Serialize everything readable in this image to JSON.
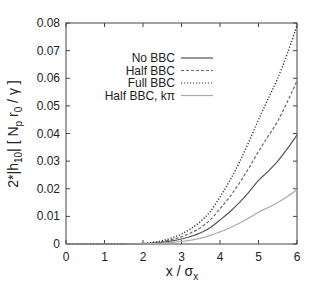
{
  "chart_data": {
    "type": "line",
    "title": "",
    "xlabel": "x / σ_x",
    "xlabel_main": "x / σ",
    "xlabel_sub": "x",
    "ylabel": "2*|h10| [Np r0 / γ]",
    "ylabel_parts": {
      "prefix": "2*|h",
      "sub1": "10",
      "mid": "|  [ N",
      "sub2": "p",
      "mid2": " r",
      "sub3": "0",
      "suffix": " / γ ]"
    },
    "xlim": [
      0,
      6
    ],
    "ylim": [
      0,
      0.08
    ],
    "xticks": [
      0,
      1,
      2,
      3,
      4,
      5,
      6
    ],
    "xtick_labels": [
      "0",
      "1",
      "2",
      "3",
      "4",
      "5",
      "6"
    ],
    "yticks": [
      0,
      0.01,
      0.02,
      0.03,
      0.04,
      0.05,
      0.06,
      0.07,
      0.08
    ],
    "ytick_labels": [
      "0",
      "0.01",
      "0.02",
      "0.03",
      "0.04",
      "0.05",
      "0.06",
      "0.07",
      "0.08"
    ],
    "grid": false,
    "legend_position": "upper-center-right (inside)",
    "x": [
      0,
      0.5,
      1,
      1.5,
      2,
      2.25,
      2.5,
      2.75,
      3,
      3.25,
      3.5,
      3.75,
      4,
      4.25,
      4.5,
      4.75,
      5,
      5.25,
      5.5,
      5.75,
      6
    ],
    "series": [
      {
        "name": "No BBC",
        "style": "solid",
        "color": "#555555",
        "values": [
          0,
          0,
          0,
          1e-05,
          0.0001,
          0.0003,
          0.0006,
          0.0011,
          0.0018,
          0.0028,
          0.0041,
          0.006,
          0.0087,
          0.0116,
          0.015,
          0.0188,
          0.023,
          0.0263,
          0.03,
          0.0345,
          0.0395
        ]
      },
      {
        "name": "Half BBC",
        "style": "dashed",
        "color": "#666666",
        "values": [
          0,
          0,
          0,
          2e-05,
          0.00015,
          0.0004,
          0.0009,
          0.0016,
          0.0026,
          0.0041,
          0.006,
          0.0088,
          0.0128,
          0.017,
          0.022,
          0.0275,
          0.0335,
          0.039,
          0.0445,
          0.0515,
          0.059
        ]
      },
      {
        "name": "Full BBC",
        "style": "dotted",
        "color": "#333333",
        "values": [
          0,
          0,
          0,
          2e-05,
          0.0002,
          0.0006,
          0.0012,
          0.0022,
          0.0036,
          0.0056,
          0.0082,
          0.0118,
          0.017,
          0.0228,
          0.0295,
          0.037,
          0.045,
          0.0525,
          0.06,
          0.069,
          0.079
        ]
      },
      {
        "name": "Half BBC, kπ",
        "style": "solid",
        "color": "#aaaaaa",
        "values": [
          0,
          0,
          0,
          5e-06,
          5e-05,
          0.00015,
          0.0003,
          0.0006,
          0.0009,
          0.0014,
          0.0021,
          0.0031,
          0.0044,
          0.0058,
          0.0075,
          0.0094,
          0.0115,
          0.0132,
          0.015,
          0.0172,
          0.0197
        ]
      }
    ]
  }
}
